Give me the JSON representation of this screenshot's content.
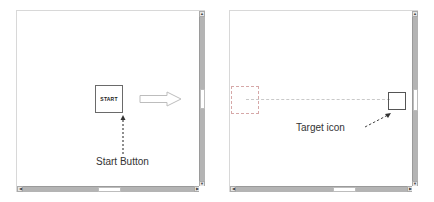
{
  "left_panel": {
    "start_button": {
      "label": "START"
    },
    "annotation": {
      "label": "Start Button"
    },
    "vertical_scrollbar": {
      "up_arrow": "▲",
      "down_arrow": "▼"
    },
    "horizontal_scrollbar": {
      "left_arrow": "◀",
      "right_arrow": "▶"
    }
  },
  "transition_arrow": {
    "icon": "right-arrow-icon"
  },
  "right_panel": {
    "annotation": {
      "label": "Target icon"
    },
    "vertical_scrollbar": {
      "up_arrow": "▲",
      "down_arrow": "▼"
    },
    "horizontal_scrollbar": {
      "left_arrow": "◀",
      "right_arrow": "▶"
    }
  },
  "colors": {
    "scrollbar_track": "#b4b4b4",
    "scrollbar_thumb": "#ffffff",
    "box_border": "#6a6a6a",
    "ghost_border": "#d6a8a8"
  }
}
